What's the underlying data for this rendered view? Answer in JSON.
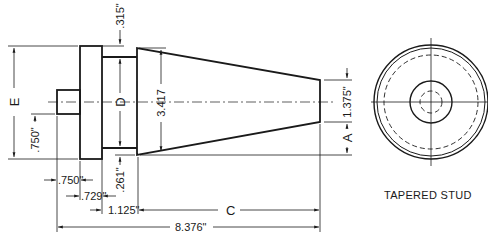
{
  "drawing": {
    "title": "TAPERED STUD",
    "labels": {
      "E": "E",
      "D": "D",
      "A": "A",
      "C": "C"
    },
    "dimensions": {
      "flange_step": ".315\"",
      "taper_large_dia": "3.417",
      "taper_small_dia": "1.375\"",
      "pin_height": ".750\"",
      "neck_offset": ".261\"",
      "pin_length": ".750\"",
      "flange_thickness": ".729\"",
      "neck_length": "1.125\"",
      "overall_length": "8.376\""
    }
  }
}
